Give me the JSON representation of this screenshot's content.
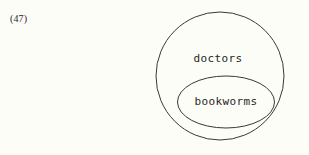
{
  "figure": {
    "example_number": "(47)",
    "background_color": "#fdfdf8",
    "stroke_color": "#3a3a33",
    "text_color": "#26261f",
    "width": 309,
    "height": 155
  },
  "diagram": {
    "type": "euler-diagram",
    "sets": [
      {
        "id": "outer",
        "label": "doctors",
        "shape": "circle",
        "cx": 220,
        "cy": 76,
        "rx": 64,
        "ry": 64,
        "label_x": 218,
        "label_y": 58
      },
      {
        "id": "inner",
        "label": "bookworms",
        "shape": "ellipse",
        "cx": 226,
        "cy": 102,
        "rx": 48.5,
        "ry": 26,
        "label_x": 226,
        "label_y": 101
      }
    ]
  }
}
